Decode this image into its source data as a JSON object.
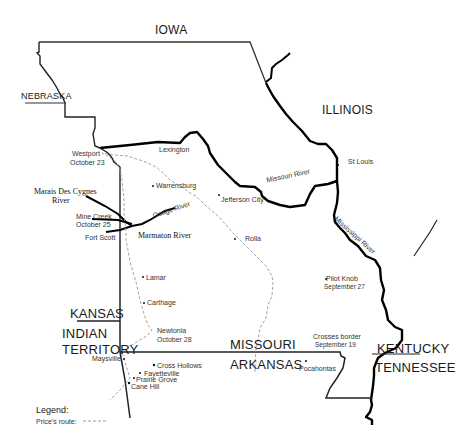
{
  "map": {
    "states": {
      "iowa": "IOWA",
      "nebraska": "NEBRASKA",
      "illinois": "ILLINOIS",
      "kansas": "KANSAS",
      "indian_territory_1": "INDIAN",
      "indian_territory_2": "TERRITORY",
      "missouri": "MISSOURI",
      "arkansas": "ARKANSAS",
      "kentucky": "KENTUCKY",
      "tennessee": "TENNESSEE"
    },
    "places": {
      "westport": "Westport",
      "westport_date": "October 23",
      "lexington": "Lexington",
      "warrensburg": "Warrensburg",
      "jefferson_city": "Jefferson City",
      "st_louis": "St Louis",
      "rolla": "Rolla",
      "pilot_knob": "Pilot Knob",
      "pilot_knob_date": "September 27",
      "crosses_border": "Crosses border",
      "crosses_border_date": "September 19",
      "pocahontas": "Pocahontas",
      "mine_creek": "Mine Creek",
      "mine_creek_date": "October 25",
      "fort_scott": "Fort Scott",
      "lamar": "Lamar",
      "carthage": "Carthage",
      "newtonia": "Newtonia",
      "newtonia_date": "October 28",
      "maysville": "Maysville",
      "cross_hollows": "Cross Hollows",
      "fayetteville": "Fayetteville",
      "prairie_grove": "Prairie Grove",
      "cane_hill": "Cane Hill"
    },
    "rivers": {
      "missouri": "Missouri River",
      "mississippi": "Mississippi River",
      "osage": "Osage River",
      "marais_1": "Marais Des Cygnes",
      "marais_2": "River",
      "marmaton": "Marmaton River"
    },
    "legend": {
      "title": "Legend:",
      "route_label": "Price's route:"
    },
    "colors": {
      "border": "#222222",
      "river": "#000000",
      "route": "#9a9a9a"
    }
  }
}
